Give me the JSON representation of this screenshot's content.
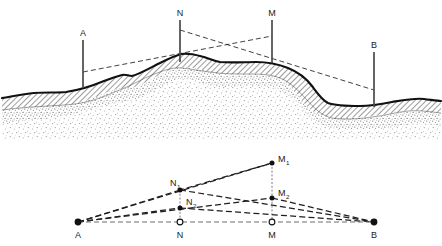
{
  "figure": {
    "title": "",
    "caption": "",
    "type": "geometric-survey-diagram",
    "colors": {
      "ink": "#1a1a1a",
      "rock_fill": "#ffffff",
      "hatch": "#333333",
      "stipple": "#7a7a7a",
      "dashed": "#2b2b2b",
      "background": "#ffffff"
    }
  },
  "upper_panel": {
    "name": "terrain-cross-section",
    "stations": [
      {
        "id": "A",
        "label": "A",
        "x": 83,
        "top_y": 40,
        "base_y": 88
      },
      {
        "id": "N",
        "label": "N",
        "x": 180,
        "top_y": 20,
        "base_y": 62
      },
      {
        "id": "M",
        "label": "M",
        "x": 272,
        "top_y": 20,
        "base_y": 63
      },
      {
        "id": "B",
        "label": "B",
        "x": 374,
        "top_y": 52,
        "base_y": 107
      }
    ],
    "sight_lines": [
      {
        "id": "A-M",
        "label": "A-M",
        "from": "A",
        "to": "M",
        "x1": 83,
        "y1": 72,
        "x2": 272,
        "y2": 36
      },
      {
        "id": "N-B",
        "label": "N-B",
        "from": "N",
        "to": "B",
        "x1": 180,
        "y1": 30,
        "x2": 374,
        "y2": 90
      }
    ],
    "ground_profile": "M 2,98 C 14,96 24,94 34,93 C 46,92 56,93 66,92 C 80,90 92,86 104,81 C 112,78 118,76 122,75 C 126,74 128,76 132,76 C 140,74 150,68 160,63 C 170,58 176,55 182,54 C 190,53 196,55 204,57 C 210,59 214,61 220,62 C 232,63 244,62 256,62 C 268,62 278,64 288,68 C 298,72 306,78 312,86 C 318,94 322,100 328,103 C 336,106 348,106 360,106 C 372,106 382,104 392,102 C 404,100 414,98 424,99 C 432,100 438,101 441,101"
  },
  "lower_panel": {
    "name": "geometric-construction",
    "baseline": {
      "id": "AB",
      "label": "A-B",
      "x1": 78,
      "y1": 222,
      "x2": 374,
      "y2": 222
    },
    "points": [
      {
        "id": "A",
        "label": "A",
        "sub": "",
        "x": 78,
        "y": 222,
        "marker": "filled",
        "label_pos": "below"
      },
      {
        "id": "N",
        "label": "N",
        "sub": "",
        "x": 180,
        "y": 222,
        "marker": "open",
        "label_pos": "below"
      },
      {
        "id": "M",
        "label": "M",
        "sub": "",
        "x": 272,
        "y": 222,
        "marker": "open",
        "label_pos": "below"
      },
      {
        "id": "B",
        "label": "B",
        "sub": "",
        "x": 374,
        "y": 222,
        "marker": "filled",
        "label_pos": "below"
      },
      {
        "id": "N1",
        "label": "N",
        "sub": "1",
        "x": 180,
        "y": 190,
        "marker": "filled",
        "label_pos": "above-left"
      },
      {
        "id": "N2",
        "label": "N",
        "sub": "2",
        "x": 180,
        "y": 208,
        "marker": "filled",
        "label_pos": "right"
      },
      {
        "id": "M1",
        "label": "M",
        "sub": "1",
        "x": 272,
        "y": 163,
        "marker": "filled",
        "label_pos": "right"
      },
      {
        "id": "M2",
        "label": "M",
        "sub": "2",
        "x": 272,
        "y": 198,
        "marker": "filled",
        "label_pos": "right"
      }
    ],
    "segments": [
      {
        "id": "A-M1",
        "label": "A to M1",
        "x1": 78,
        "y1": 222,
        "x2": 272,
        "y2": 163,
        "style": "dashed-heavy"
      },
      {
        "id": "M1-N1",
        "label": "M1 to N1",
        "x1": 272,
        "y1": 163,
        "x2": 180,
        "y2": 190,
        "style": "dashed-heavy"
      },
      {
        "id": "N1-A",
        "label": "N1 to A",
        "x1": 180,
        "y1": 190,
        "x2": 78,
        "y2": 222,
        "style": "dashed-heavy"
      },
      {
        "id": "N1-B",
        "label": "N1 to B",
        "x1": 180,
        "y1": 190,
        "x2": 374,
        "y2": 222,
        "style": "dashed-heavy"
      },
      {
        "id": "A-M2",
        "label": "A to M2",
        "x1": 78,
        "y1": 222,
        "x2": 272,
        "y2": 198,
        "style": "dashed-heavy"
      },
      {
        "id": "M2-B",
        "label": "M2 to B",
        "x1": 272,
        "y1": 198,
        "x2": 374,
        "y2": 222,
        "style": "dashed-heavy"
      },
      {
        "id": "A-N2",
        "label": "A to N2",
        "x1": 78,
        "y1": 222,
        "x2": 180,
        "y2": 208,
        "style": "dashed-heavy"
      },
      {
        "id": "N2-B",
        "label": "N2 to B",
        "x1": 180,
        "y1": 208,
        "x2": 374,
        "y2": 222,
        "style": "dashed-heavy"
      },
      {
        "id": "N1-N2",
        "label": "N1 to N2",
        "x1": 180,
        "y1": 190,
        "x2": 180,
        "y2": 208,
        "style": "dotted-thin"
      },
      {
        "id": "N2-N",
        "label": "N2 to N",
        "x1": 180,
        "y1": 208,
        "x2": 180,
        "y2": 222,
        "style": "dotted-thin"
      },
      {
        "id": "M1-M2",
        "label": "M1 to M2",
        "x1": 272,
        "y1": 163,
        "x2": 272,
        "y2": 198,
        "style": "dotted-thin"
      },
      {
        "id": "M2-M",
        "label": "M2 to M",
        "x1": 272,
        "y1": 198,
        "x2": 272,
        "y2": 222,
        "style": "dotted-thin"
      }
    ]
  }
}
